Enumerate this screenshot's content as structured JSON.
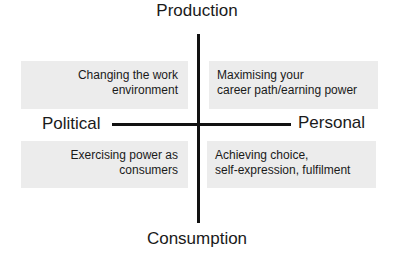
{
  "axes": {
    "top": "Production",
    "bottom": "Consumption",
    "left": "Political",
    "right": "Personal"
  },
  "quadrants": {
    "top_left": {
      "lines": [
        "Changing the work",
        "environment"
      ]
    },
    "top_right": {
      "lines": [
        "Maximising your",
        "career path/earning power"
      ]
    },
    "bottom_left": {
      "lines": [
        "Exercising power as",
        "consumers"
      ]
    },
    "bottom_right": {
      "lines": [
        "Achieving choice,",
        "self-expression, fulfilment"
      ]
    }
  },
  "colors": {
    "box_fill": "#ececec",
    "axis_line": "#111111",
    "text": "#1a1a1a"
  }
}
